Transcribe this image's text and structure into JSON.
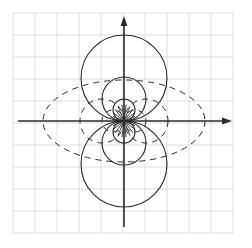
{
  "figure": {
    "title": "",
    "background_color": "#ffffff",
    "width": 252,
    "height": 248
  },
  "grid": {
    "color": "#d6d6d6",
    "line_width": 0.8,
    "x_start": 13,
    "y_start": 13,
    "spacing": 22,
    "columns": 10,
    "rows": 10,
    "x_end": 233,
    "y_end": 233,
    "visible": true
  },
  "axes": {
    "color": "#2b2b2b",
    "line_width": 1.6,
    "origin": {
      "x": 124,
      "y": 121
    },
    "x_axis": {
      "x1": 18,
      "y1": 121,
      "x2": 232,
      "y2": 121,
      "arrow": "right"
    },
    "y_axis": {
      "x1": 124,
      "y1": 227,
      "x2": 124,
      "y2": 16,
      "arrow": "up"
    },
    "arrow_size": 7,
    "tick_labels": []
  },
  "chart_data": {
    "type": "diagram",
    "xlabel": "x",
    "ylabel": "y",
    "grid": true,
    "legend": null,
    "origin_px": {
      "x": 124,
      "y": 121
    },
    "unit_px": 22,
    "solid_circles": {
      "style": "solid",
      "color": "#2b2b2b",
      "line_width": 1.1,
      "description": "Circles tangent to the x-axis at the origin (centers on the y-axis)",
      "items": [
        {
          "center_x": 124,
          "center_y": 78,
          "radius": 43,
          "tangent": "x-axis",
          "side": "upper"
        },
        {
          "center_x": 124,
          "center_y": 99,
          "radius": 22,
          "tangent": "x-axis",
          "side": "upper"
        },
        {
          "center_x": 124,
          "center_y": 110,
          "radius": 11,
          "tangent": "x-axis",
          "side": "upper"
        },
        {
          "center_x": 124,
          "center_y": 164,
          "radius": 43,
          "tangent": "x-axis",
          "side": "lower"
        },
        {
          "center_x": 124,
          "center_y": 143,
          "radius": 22,
          "tangent": "x-axis",
          "side": "lower"
        },
        {
          "center_x": 124,
          "center_y": 132,
          "radius": 11,
          "tangent": "x-axis",
          "side": "lower"
        }
      ]
    },
    "dashed_circles": {
      "style": "dashed",
      "color": "#2b2b2b",
      "line_width": 1.0,
      "dash_pattern": "6 5",
      "description": "Circles tangent to the y-axis at the origin (centers on the x-axis)",
      "items": [
        {
          "center_x": 102,
          "center_y": 121,
          "radius": 22,
          "tangent": "y-axis",
          "side": "left"
        },
        {
          "center_x": 146,
          "center_y": 121,
          "radius": 22,
          "tangent": "y-axis",
          "side": "right"
        },
        {
          "center_x": 113,
          "center_y": 121,
          "radius": 11,
          "tangent": "y-axis",
          "side": "left"
        },
        {
          "center_x": 135,
          "center_y": 121,
          "radius": 11,
          "tangent": "y-axis",
          "side": "right"
        }
      ]
    },
    "dashed_ellipse": {
      "style": "dashed",
      "color": "#2b2b2b",
      "line_width": 1.0,
      "dash_pattern": "6 5",
      "center_x": 124,
      "center_y": 121,
      "radius_x": 81,
      "radius_y": 41,
      "description": "Outer dashed ellipse enclosing the circle families"
    },
    "origin_rays": {
      "style": "solid",
      "color": "#2b2b2b",
      "line_width": 0.9,
      "description": "Short radial strokes emanating from the origin through the small lobes",
      "count": 24,
      "inner_radius": 2,
      "outer_radius": 16
    }
  }
}
